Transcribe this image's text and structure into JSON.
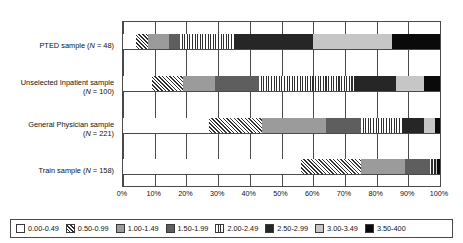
{
  "chart_data": {
    "type": "bar",
    "orientation": "horizontal",
    "stacked": true,
    "title": "",
    "xlabel": "",
    "ylabel": "",
    "xlim": [
      0,
      100
    ],
    "xunit": "%",
    "grid": true,
    "legend_position": "bottom",
    "categories": [
      "PTED sample (N = 48)",
      "Unselected Inpatient sample (N = 100)",
      "General Physician sample (N = 221)",
      "Train sample (N = 158)"
    ],
    "category_lines": [
      [
        "PTED sample (N = 48)"
      ],
      [
        "Unselected Inpatient sample",
        "(N = 100)"
      ],
      [
        "General Physician sample",
        "(N = 221)"
      ],
      [
        "Train sample (N = 158)"
      ]
    ],
    "xticks": [
      "0%",
      "10%",
      "20%",
      "30%",
      "40%",
      "50%",
      "60%",
      "70%",
      "80%",
      "90%",
      "100%"
    ],
    "xtick_values": [
      0,
      10,
      20,
      30,
      40,
      50,
      60,
      70,
      80,
      90,
      100
    ],
    "series": [
      {
        "name": "0.00-0.49",
        "pattern": "solid-white",
        "color": "#ffffff",
        "values": [
          4.0,
          9.0,
          27.0,
          56.0
        ]
      },
      {
        "name": "0.50-0.99",
        "pattern": "diagonal-hatch",
        "color": "#ffffff",
        "values": [
          4.0,
          10.0,
          17.0,
          19.0
        ]
      },
      {
        "name": "1.00-1.49",
        "pattern": "solid-gray",
        "color": "#9b9b9b",
        "values": [
          6.5,
          10.0,
          20.0,
          14.0
        ]
      },
      {
        "name": "1.50-1.99",
        "pattern": "solid-dark-gray",
        "color": "#5e5e5e",
        "values": [
          3.5,
          14.0,
          11.0,
          8.0
        ]
      },
      {
        "name": "2.00-2.49",
        "pattern": "vertical-stripe",
        "color": "#ffffff",
        "values": [
          17.0,
          30.0,
          13.0,
          1.0
        ]
      },
      {
        "name": "2.50-2.99",
        "pattern": "solid-black",
        "color": "#262626",
        "values": [
          25.0,
          13.0,
          7.0,
          0.7
        ]
      },
      {
        "name": "3.00-3.49",
        "pattern": "solid-light-gray",
        "color": "#c6c6c6",
        "values": [
          25.0,
          9.0,
          3.5,
          0.3
        ]
      },
      {
        "name": "3.50-400",
        "pattern": "solid-black",
        "color": "#0a0a0a",
        "values": [
          15.0,
          5.0,
          1.5,
          1.0
        ]
      }
    ],
    "legend_entries": [
      "0.00-0.49",
      "0.50-0.99",
      "1.00-1.49",
      "1.50-1.99",
      "2.00-2.49",
      "2.50-2.99",
      "3.00-3.49",
      "3.50-400"
    ]
  }
}
